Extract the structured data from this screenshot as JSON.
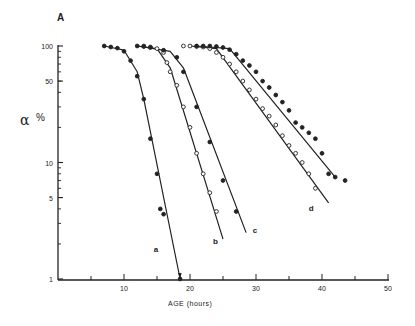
{
  "panel_label": "A",
  "chart_data": {
    "type": "scatter",
    "title": "",
    "panel": "A",
    "xlabel": "AGE (hours)",
    "ylabel": "α",
    "ylabel_unit": "%",
    "xscale": "linear",
    "yscale": "log",
    "xlim": [
      0,
      50
    ],
    "ylim": [
      1,
      100
    ],
    "xticks": [
      10,
      20,
      30,
      40,
      50
    ],
    "xtick_labels": [
      "10",
      "20",
      "30",
      "40",
      "50"
    ],
    "yticks": [
      1,
      5,
      10,
      50,
      100
    ],
    "ytick_labels": [
      "1",
      "5",
      "10",
      "50",
      "100"
    ],
    "grid": false,
    "legend": "curve letters labeled at line ends",
    "series": [
      {
        "name": "a",
        "marker": "filled",
        "x": [
          7,
          8,
          9,
          10,
          11,
          12,
          13,
          14,
          15,
          15.5,
          16,
          18.5
        ],
        "y": [
          100,
          98,
          96,
          90,
          75,
          55,
          35,
          16,
          8,
          4,
          3.6,
          1
        ],
        "line": [
          [
            7,
            100
          ],
          [
            10,
            92
          ],
          [
            12,
            60
          ],
          [
            13,
            35
          ],
          [
            18.5,
            1
          ]
        ],
        "label_pos": [
          14.5,
          1.7
        ]
      },
      {
        "name": "b",
        "marker": "open",
        "x": [
          13,
          14,
          15,
          16,
          16.5,
          17,
          18,
          19,
          20,
          21,
          22,
          23,
          24
        ],
        "y": [
          100,
          98,
          95,
          88,
          72,
          60,
          46,
          30,
          20,
          12,
          8,
          5.5,
          3.8
        ],
        "line": [
          [
            12,
            100
          ],
          [
            15,
            95
          ],
          [
            17,
            65
          ],
          [
            25,
            2.2
          ]
        ],
        "label_pos": [
          23.5,
          2
        ]
      },
      {
        "name": "c",
        "marker": "filled",
        "x": [
          12,
          13,
          14,
          16,
          18,
          19,
          21,
          23,
          25,
          27
        ],
        "y": [
          100,
          99,
          97,
          92,
          80,
          60,
          30,
          15,
          7,
          3.8
        ],
        "line": [
          [
            12,
            100
          ],
          [
            17,
            90
          ],
          [
            19,
            65
          ],
          [
            28.5,
            2.5
          ]
        ],
        "label_pos": [
          29.5,
          2.5
        ]
      },
      {
        "name": "d",
        "marker": "open",
        "x": [
          19,
          20,
          21,
          22,
          23,
          24,
          25,
          26,
          27,
          28,
          29,
          30,
          31,
          32,
          33,
          34,
          35,
          36,
          37,
          38,
          39
        ],
        "y": [
          100,
          100,
          99,
          98,
          95,
          88,
          80,
          70,
          60,
          50,
          42,
          35,
          29,
          25,
          21,
          17,
          14,
          12,
          10,
          8,
          6
        ],
        "line": [
          [
            20,
            100
          ],
          [
            24,
            95
          ],
          [
            41,
            4.5
          ]
        ],
        "label_pos": [
          38,
          3.8
        ]
      },
      {
        "name": "e",
        "marker": "filled",
        "x": [
          21,
          22,
          23,
          24,
          25,
          26,
          27,
          28,
          29,
          30,
          31,
          32,
          33,
          34,
          35,
          36,
          37,
          38,
          39,
          40,
          41,
          42,
          43.5
        ],
        "y": [
          100,
          100,
          100,
          99,
          97,
          93,
          85,
          75,
          68,
          60,
          50,
          44,
          38,
          33,
          28,
          22,
          20,
          18,
          16,
          12,
          8,
          7.5,
          7
        ],
        "line": [
          [
            21,
            100
          ],
          [
            26,
            95
          ],
          [
            42,
            7.5
          ]
        ],
        "label_pos": null
      }
    ]
  }
}
